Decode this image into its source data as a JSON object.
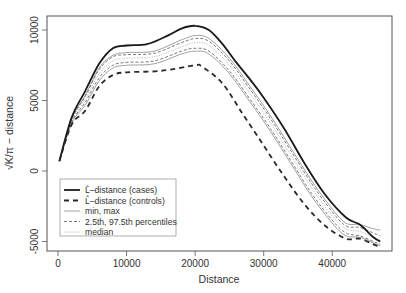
{
  "chart_data": {
    "type": "line",
    "title": "",
    "xlabel": "Distance",
    "ylabel": "√K/π − distance",
    "xlim": [
      -1700,
      48800
    ],
    "ylim": [
      -5700,
      11100
    ],
    "x_ticks": [
      0,
      10000,
      20000,
      30000,
      40000
    ],
    "y_ticks": [
      -5000,
      0,
      5000,
      10000
    ],
    "grid": false,
    "legend_position": "bottom-left",
    "legend": [
      {
        "label": "L̂–distance (cases)",
        "style": "solid-thick"
      },
      {
        "label": "L̂–distance (controls)",
        "style": "dashed-thick"
      },
      {
        "label": "min, max",
        "style": "solid-thin"
      },
      {
        "label": "2.5th, 97.5th percentiles",
        "style": "dashed-thin"
      },
      {
        "label": "median",
        "style": "dotted"
      }
    ],
    "series": [
      {
        "name": "L-distance (cases)",
        "style": "solid-thick",
        "x": [
          200,
          2000,
          4000,
          6000,
          8000,
          10000,
          13000,
          16000,
          18000,
          20000,
          22000,
          24000,
          26000,
          28000,
          30000,
          33000,
          36000,
          39000,
          42000,
          44000,
          46000,
          47000
        ],
        "y": [
          700,
          3800,
          5700,
          7600,
          8700,
          8900,
          9000,
          9600,
          10100,
          10300,
          10000,
          9000,
          7700,
          6500,
          5200,
          3000,
          500,
          -1700,
          -3300,
          -3800,
          -4700,
          -5000
        ]
      },
      {
        "name": "L-distance (controls)",
        "style": "dashed-thick",
        "x": [
          200,
          2000,
          4000,
          6000,
          8000,
          10000,
          15000,
          20000,
          21000,
          24000,
          27000,
          30000,
          33000,
          36000,
          39000,
          42000,
          44000,
          46000,
          47000
        ],
        "y": [
          700,
          3300,
          4300,
          6000,
          6800,
          7000,
          7100,
          7500,
          7400,
          6200,
          4000,
          1800,
          -400,
          -2400,
          -3900,
          -4800,
          -4800,
          -5200,
          -5400
        ]
      },
      {
        "name": "max",
        "style": "solid-thin",
        "x": [
          200,
          2000,
          4000,
          6000,
          8000,
          10000,
          14000,
          18000,
          20000,
          22000,
          25000,
          28000,
          31000,
          34000,
          37000,
          40000,
          42000,
          44000,
          46000,
          47000
        ],
        "y": [
          700,
          3700,
          5400,
          7300,
          8200,
          8400,
          8500,
          9300,
          9600,
          9400,
          8000,
          6000,
          3900,
          1600,
          -700,
          -2700,
          -3700,
          -3800,
          -4100,
          -4200
        ]
      },
      {
        "name": "97.5th percentile",
        "style": "dashed-thin",
        "x": [
          200,
          2000,
          4000,
          6000,
          8000,
          10000,
          14000,
          18000,
          20000,
          22000,
          25000,
          28000,
          31000,
          34000,
          37000,
          40000,
          42000,
          44000,
          46000,
          47000
        ],
        "y": [
          700,
          3650,
          5300,
          7200,
          8100,
          8250,
          8350,
          9100,
          9400,
          9200,
          7800,
          5800,
          3700,
          1400,
          -900,
          -2900,
          -3900,
          -4000,
          -4400,
          -4600
        ]
      },
      {
        "name": "median",
        "style": "dotted",
        "x": [
          200,
          2000,
          4000,
          6000,
          8000,
          10000,
          14000,
          18000,
          20000,
          22000,
          25000,
          28000,
          31000,
          34000,
          37000,
          40000,
          42000,
          44000,
          46000,
          47000
        ],
        "y": [
          700,
          3550,
          5100,
          6900,
          7800,
          8000,
          8100,
          8800,
          9100,
          8900,
          7500,
          5500,
          3400,
          1100,
          -1200,
          -3200,
          -4100,
          -4300,
          -4700,
          -4900
        ]
      },
      {
        "name": "2.5th percentile",
        "style": "dashed-thin",
        "x": [
          200,
          2000,
          4000,
          6000,
          8000,
          10000,
          14000,
          18000,
          20000,
          22000,
          25000,
          28000,
          31000,
          34000,
          37000,
          40000,
          42000,
          44000,
          46000,
          47000
        ],
        "y": [
          700,
          3450,
          4900,
          6600,
          7500,
          7700,
          7800,
          8500,
          8700,
          8500,
          7100,
          5100,
          3000,
          700,
          -1600,
          -3500,
          -4400,
          -4600,
          -5000,
          -5200
        ]
      },
      {
        "name": "min",
        "style": "solid-thin",
        "x": [
          200,
          2000,
          4000,
          6000,
          8000,
          10000,
          14000,
          18000,
          20000,
          22000,
          25000,
          28000,
          31000,
          34000,
          37000,
          40000,
          42000,
          44000,
          46000,
          47000
        ],
        "y": [
          700,
          3400,
          4700,
          6400,
          7300,
          7500,
          7600,
          8300,
          8500,
          8300,
          6900,
          4900,
          2800,
          500,
          -1800,
          -3700,
          -4600,
          -4700,
          -5100,
          -5300
        ]
      }
    ]
  },
  "colors": {
    "axis": "#555555",
    "cases": "#1a1a1a",
    "controls": "#2a2a2a",
    "envelope": "#888888",
    "percentile": "#555555",
    "median": "#999999"
  }
}
